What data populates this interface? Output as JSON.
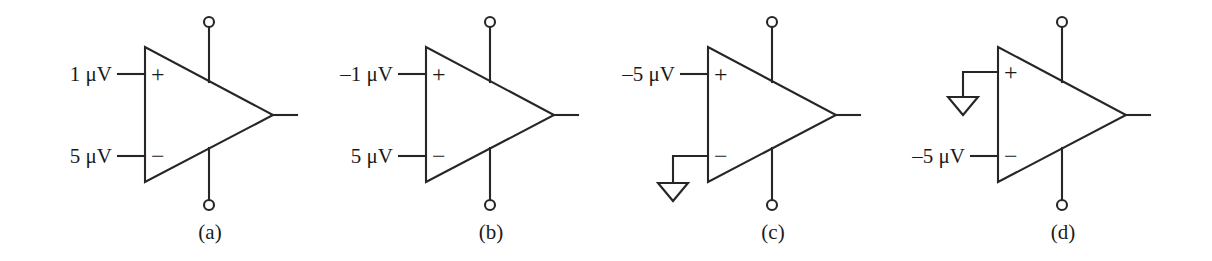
{
  "figure": {
    "type": "circuit-diagram",
    "line_color": "#262626",
    "background_color": "#ffffff"
  },
  "circuits": [
    {
      "id": "a",
      "caption": "(a)",
      "plus_label": "1 μV",
      "minus_label": "5 μV",
      "plus_sign": "+",
      "minus_sign": "−",
      "plus_grounded": false,
      "minus_grounded": false,
      "has_top_supply_pin": true,
      "has_bottom_supply_pin": true,
      "has_output_wire": true
    },
    {
      "id": "b",
      "caption": "(b)",
      "plus_label": "–1 μV",
      "minus_label": "5 μV",
      "plus_sign": "+",
      "minus_sign": "−",
      "plus_grounded": false,
      "minus_grounded": false,
      "has_top_supply_pin": true,
      "has_bottom_supply_pin": true,
      "has_output_wire": true
    },
    {
      "id": "c",
      "caption": "(c)",
      "plus_label": "–5 μV",
      "minus_label": "",
      "plus_sign": "+",
      "minus_sign": "−",
      "plus_grounded": false,
      "minus_grounded": true,
      "has_top_supply_pin": true,
      "has_bottom_supply_pin": true,
      "has_output_wire": true
    },
    {
      "id": "d",
      "caption": "(d)",
      "plus_label": "",
      "minus_label": "–5 μV",
      "plus_sign": "+",
      "minus_sign": "−",
      "plus_grounded": true,
      "minus_grounded": false,
      "has_top_supply_pin": true,
      "has_bottom_supply_pin": true,
      "has_output_wire": true
    }
  ]
}
